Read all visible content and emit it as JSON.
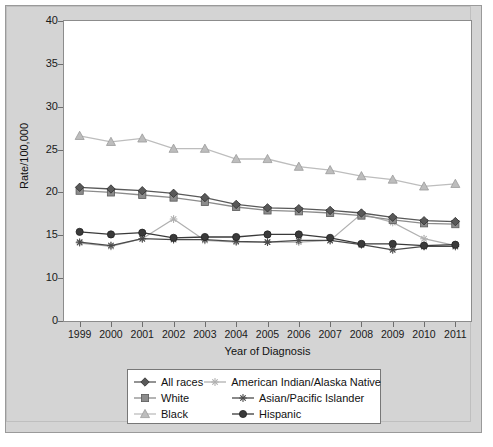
{
  "figure": {
    "background": "#d4d4d4",
    "plot_background": "#ffffff"
  },
  "chart_data": {
    "type": "line",
    "title": "",
    "xlabel": "Year of Diagnosis",
    "ylabel": "Rate/100,000",
    "x": [
      1999,
      2000,
      2001,
      2002,
      2003,
      2004,
      2005,
      2006,
      2007,
      2008,
      2009,
      2010,
      2011
    ],
    "categories": [
      "1999",
      "2000",
      "2001",
      "2002",
      "2003",
      "2004",
      "2005",
      "2006",
      "2007",
      "2008",
      "2009",
      "2010",
      "2011"
    ],
    "ylim": [
      0,
      40
    ],
    "yticks": [
      0,
      10,
      15,
      20,
      25,
      30,
      35,
      40
    ],
    "ytick_labels": [
      "0",
      "10",
      "15",
      "20",
      "25",
      "30",
      "35",
      "40"
    ],
    "grid": false,
    "legend_position": "below-axes",
    "axis_note": "y-axis compressed between 0 and 10",
    "series": [
      {
        "name": "All races",
        "color": "#595959",
        "marker": "diamond",
        "values": [
          20.6,
          20.4,
          20.2,
          19.9,
          19.4,
          18.6,
          18.2,
          18.1,
          17.9,
          17.6,
          17.1,
          16.7,
          16.6
        ]
      },
      {
        "name": "White",
        "color": "#8c8c8c",
        "marker": "square",
        "values": [
          20.2,
          20.0,
          19.7,
          19.4,
          18.9,
          18.3,
          17.9,
          17.8,
          17.6,
          17.3,
          16.8,
          16.4,
          16.3
        ]
      },
      {
        "name": "Black",
        "color": "#bdbdbd",
        "marker": "triangle",
        "values": [
          26.6,
          25.9,
          26.3,
          25.1,
          25.1,
          23.9,
          23.9,
          23.0,
          22.6,
          21.9,
          21.5,
          20.7,
          21.0
        ]
      },
      {
        "name": "American Indian/Alaska Native",
        "color": "#b0b0b0",
        "marker": "asterisk",
        "values": [
          14.1,
          13.7,
          14.6,
          16.9,
          14.4,
          14.2,
          14.2,
          14.2,
          14.4,
          17.5,
          16.5,
          14.6,
          13.8
        ]
      },
      {
        "name": "Asian/Pacific Islander",
        "color": "#4a4a4a",
        "marker": "asterisk",
        "values": [
          14.2,
          13.8,
          14.6,
          14.5,
          14.5,
          14.3,
          14.2,
          14.4,
          14.4,
          13.9,
          13.3,
          13.7,
          13.7
        ]
      },
      {
        "name": "Hispanic",
        "color": "#3a3a3a",
        "marker": "circle",
        "values": [
          15.4,
          15.1,
          15.3,
          14.7,
          14.8,
          14.8,
          15.1,
          15.1,
          14.7,
          14.0,
          14.0,
          13.8,
          13.9
        ]
      }
    ]
  },
  "legend": {
    "entries": [
      {
        "label": "All races",
        "marker": "diamond",
        "color": "#595959"
      },
      {
        "label": "American Indian/Alaska Native",
        "marker": "asterisk",
        "color": "#b0b0b0"
      },
      {
        "label": "White",
        "marker": "square",
        "color": "#8c8c8c"
      },
      {
        "label": "Asian/Pacific Islander",
        "marker": "asterisk",
        "color": "#4a4a4a"
      },
      {
        "label": "Black",
        "marker": "triangle",
        "color": "#bdbdbd"
      },
      {
        "label": "Hispanic",
        "marker": "circle",
        "color": "#3a3a3a"
      }
    ]
  }
}
